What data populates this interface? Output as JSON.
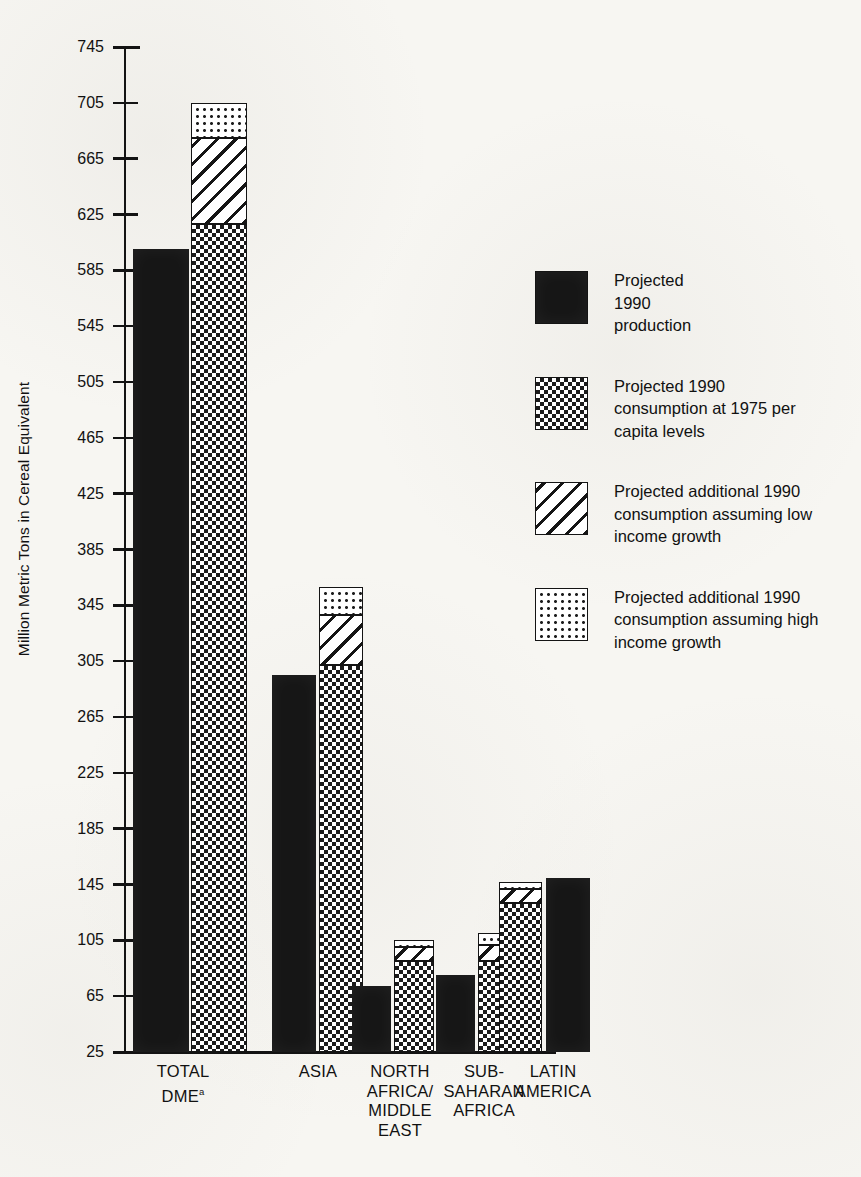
{
  "axis": {
    "y_title": "Million Metric Tons in Cereal Equivalent",
    "ticks": [
      745,
      705,
      665,
      625,
      585,
      545,
      505,
      465,
      425,
      385,
      345,
      305,
      265,
      225,
      185,
      145,
      105,
      65,
      25
    ]
  },
  "categories": [
    {
      "id": "total-dme",
      "label": "TOTAL\nDME",
      "superscript": "a"
    },
    {
      "id": "asia",
      "label": "ASIA",
      "superscript": ""
    },
    {
      "id": "north-africa-middle-east",
      "label": "NORTH\nAFRICA/\nMIDDLE\nEAST",
      "superscript": ""
    },
    {
      "id": "sub-saharan-africa",
      "label": "SUB-\nSAHARAN\nAFRICA",
      "superscript": ""
    },
    {
      "id": "latin-america",
      "label": "LATIN\nAMERICA",
      "superscript": ""
    }
  ],
  "legend": [
    {
      "id": "production",
      "pattern": "solid-black",
      "label": "Projected\n1990\nproduction"
    },
    {
      "id": "consumption-1975",
      "pattern": "checkerboard",
      "label": "Projected 1990\nconsumption at 1975 per\ncapita levels"
    },
    {
      "id": "additional-low-growth",
      "pattern": "diagonal-hatch",
      "label": "Projected additional 1990\nconsumption assuming low\nincome growth"
    },
    {
      "id": "additional-high-growth",
      "pattern": "stipple-dots",
      "label": "Projected additional 1990\nconsumption assuming high\nincome growth"
    }
  ],
  "chart_data": {
    "type": "bar",
    "title": "",
    "xlabel": "",
    "ylabel": "Million Metric Tons in Cereal Equivalent",
    "ylim": [
      25,
      745
    ],
    "ytick_step": 40,
    "grid": false,
    "legend_position": "right",
    "bar_grouping": "paired: production bar beside stacked consumption bar",
    "categories": [
      "TOTAL DME",
      "ASIA",
      "NORTH AFRICA/MIDDLE EAST",
      "SUB-SAHARAN AFRICA",
      "LATIN AMERICA"
    ],
    "series": [
      {
        "name": "Projected 1990 production",
        "pattern": "solid-black",
        "stacked": false,
        "values": [
          600,
          295,
          72,
          80,
          150
        ]
      },
      {
        "name": "Projected 1990 consumption at 1975 per capita levels",
        "pattern": "checkerboard",
        "stacked": true,
        "stack_order": 1,
        "values": [
          618,
          302,
          90,
          90,
          132
        ]
      },
      {
        "name": "Projected additional 1990 consumption assuming low income growth",
        "pattern": "diagonal-hatch",
        "stacked": true,
        "stack_order": 2,
        "values": [
          62,
          36,
          10,
          12,
          10
        ],
        "cumulative_tops": [
          680,
          338,
          100,
          102,
          142
        ]
      },
      {
        "name": "Projected additional 1990 consumption assuming high income growth",
        "pattern": "stipple-dots",
        "stacked": true,
        "stack_order": 3,
        "values": [
          25,
          20,
          5,
          8,
          5
        ],
        "cumulative_tops": [
          705,
          358,
          105,
          110,
          147
        ]
      }
    ]
  }
}
